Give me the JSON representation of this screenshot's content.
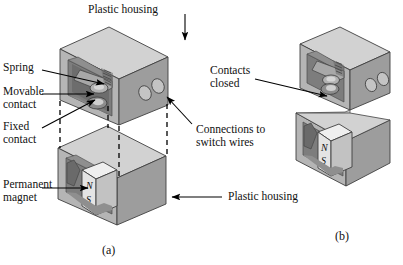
{
  "figure": {
    "background_color": "#ffffff",
    "ink_color": "#000000"
  },
  "labels": {
    "plastic_housing_top": "Plastic housing",
    "spring": "Spring",
    "movable_contact": "Movable\ncontact",
    "fixed_contact": "Fixed\ncontact",
    "permanent_magnet": "Permanent\nmagnet",
    "connections_to_switch_wires": "Connections to\nswitch wires",
    "plastic_housing_bottom": "Plastic housing",
    "contacts_closed": "Contacts\nclosed"
  },
  "magnet_poles": {
    "north": "N",
    "south": "S"
  },
  "captions": {
    "panel_a": "(a)",
    "panel_b": "(b)"
  },
  "shading": {
    "top_face": "#d8d8d8",
    "front_face": "#b9b9b9",
    "side_face": "#9a9a9a",
    "cavity_dark": "#6f6f6f",
    "cavity_mid": "#8a8a8a",
    "magnet_face": "#e3e3e3",
    "magnet_side": "#bdbdbd",
    "outline": "#3a3a3a"
  }
}
